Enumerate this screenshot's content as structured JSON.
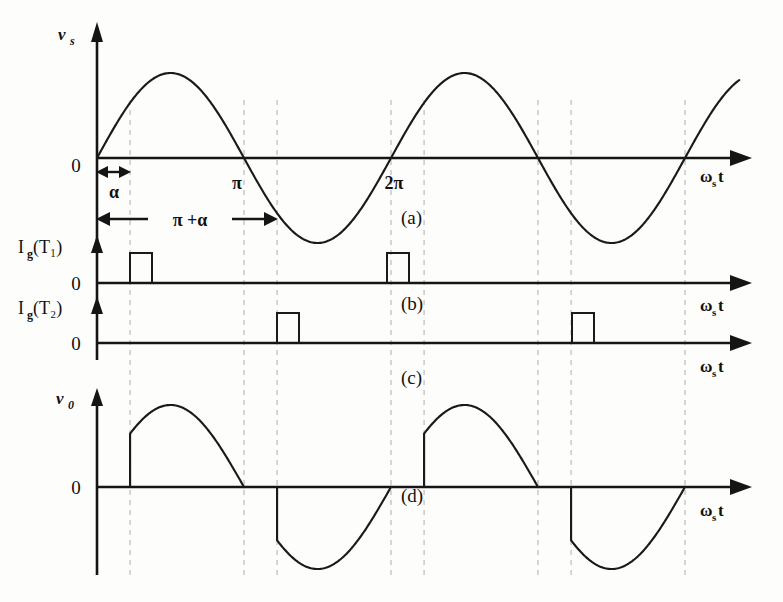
{
  "figure": {
    "background_color": "#fdfdfc",
    "ink_color": "#151515",
    "grid_color": "#b9b9b9"
  },
  "axis_labels": {
    "omega_main": "ω",
    "omega_sub": "s",
    "omega_tail": "t",
    "zero": "0"
  },
  "panels": [
    {
      "id": "a",
      "tag": "(a)",
      "y_label_main": "v",
      "y_label_sub": "s",
      "x_axis_label": "ωₕt",
      "description": "source voltage sinusoid"
    },
    {
      "id": "b",
      "tag": "(b)",
      "y_label_main": "I",
      "y_label_sub": "g",
      "y_label_arg": "(T₁)",
      "y_label_plain": "Ig(T1)",
      "x_axis_label": "ωₕt",
      "description": "gate pulse to thyristor T1"
    },
    {
      "id": "c",
      "tag": "(c)",
      "y_label_main": "I",
      "y_label_sub": "g",
      "y_label_arg": "(T₂)",
      "y_label_plain": "Ig(T2)",
      "x_axis_label": "ωₕt",
      "description": "gate pulse to thyristor T2"
    },
    {
      "id": "d",
      "tag": "(d)",
      "y_label_main": "v",
      "y_label_sub": "0",
      "x_axis_label": "ωₕt",
      "description": "output voltage across load"
    }
  ],
  "tick_labels": [
    {
      "text": "π",
      "x": 241
    },
    {
      "text": "2π",
      "x": 388
    }
  ],
  "annotations": [
    {
      "name": "alpha",
      "text": "α",
      "from_x": 97,
      "to_x": 130
    },
    {
      "name": "pi-plus-alpha",
      "text": "π +α",
      "from_x": 97,
      "to_x": 277
    }
  ],
  "chart_data": {
    "type": "line",
    "xlabel": "ωₕt",
    "x_unit": "radians",
    "firing_angle_alpha_rad": 0.707,
    "grid": true,
    "gridlines_x": [
      0.707,
      3.1416,
      3.8486,
      6.2832,
      6.9902,
      9.4248,
      10.1318,
      12.5664
    ],
    "x_range": [
      0,
      13.2
    ],
    "axis_pixels": {
      "origin_x": 97,
      "pi_px": 241,
      "half_period_px": 147,
      "x_end": 740
    },
    "series": [
      {
        "name": "vs",
        "panel": "a",
        "type": "sine",
        "ylabel": "v_s",
        "amplitude": 1.0,
        "phase": 0,
        "cycles": 2,
        "ylim": [
          -1.2,
          1.2
        ],
        "baseline_y": 158,
        "amp_px": 85
      },
      {
        "name": "Ig(T1)",
        "panel": "b",
        "type": "pulse-train",
        "ylabel": "I_g(T1)",
        "baseline_y": 283,
        "pulse_height_px": 30,
        "pulse_width_px": 22,
        "pulse_start_x": [
          0.707,
          6.9902
        ],
        "pulse_start_px": [
          130,
          387
        ],
        "ylim": [
          0,
          1
        ]
      },
      {
        "name": "Ig(T2)",
        "panel": "c",
        "type": "pulse-train",
        "ylabel": "I_g(T2)",
        "baseline_y": 343,
        "pulse_height_px": 30,
        "pulse_width_px": 22,
        "pulse_start_x": [
          3.8486,
          10.1318
        ],
        "pulse_start_px": [
          277,
          572
        ],
        "ylim": [
          0,
          1
        ]
      },
      {
        "name": "v0",
        "panel": "d",
        "type": "phase-controlled-sine",
        "ylabel": "v_0",
        "amplitude": 1.0,
        "conduction_start_rad": [
          0.707,
          3.8486,
          6.9902,
          10.1318
        ],
        "conduction_end_rad": [
          3.1416,
          6.2832,
          9.4248,
          12.5664
        ],
        "baseline_y": 487,
        "amp_px": 82,
        "ylim": [
          -1.2,
          1.2
        ]
      }
    ]
  }
}
